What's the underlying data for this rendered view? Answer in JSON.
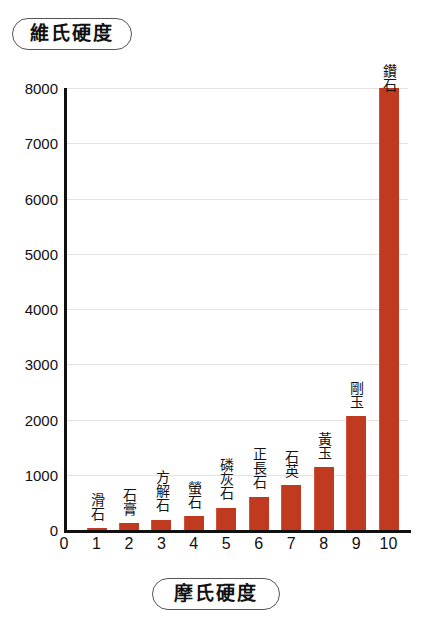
{
  "axis_titles": {
    "y": "維氏硬度",
    "x": "摩氏硬度"
  },
  "colors": {
    "bar": "#bf3a1e",
    "bar_highlight": "#d0543a",
    "axis": "#111111",
    "gridline": "#e6e2e0",
    "background": "#ffffff"
  },
  "chart_data": {
    "type": "bar",
    "title": "",
    "subtitle": "",
    "xlabel": "摩氏硬度",
    "ylabel": "維氏硬度",
    "categories": [
      1,
      2,
      3,
      4,
      5,
      6,
      7,
      8,
      9,
      10
    ],
    "values": [
      30,
      120,
      190,
      260,
      400,
      600,
      820,
      1150,
      2060,
      8000
    ],
    "point_labels": [
      "滑石",
      "石膏",
      "方解石",
      "螢石",
      "磷灰石",
      "正長石",
      "石英",
      "黃玉",
      "剛玉",
      "鑽石"
    ],
    "series": [
      {
        "name": "維氏硬度",
        "values": [
          30,
          120,
          190,
          260,
          400,
          600,
          820,
          1150,
          2060,
          8000
        ]
      }
    ],
    "xlim": [
      0,
      10.6
    ],
    "ylim": [
      0,
      8000
    ],
    "xticks": [
      0,
      1,
      2,
      3,
      4,
      5,
      6,
      7,
      8,
      9,
      10
    ],
    "xtick_labels": [
      "0",
      "1",
      "2",
      "3",
      "4",
      "5",
      "6",
      "7",
      "8",
      "9",
      "10"
    ],
    "yticks": [
      0,
      1000,
      2000,
      3000,
      4000,
      5000,
      6000,
      7000,
      8000
    ],
    "ytick_labels": [
      "0",
      "1000",
      "2000",
      "3000",
      "4000",
      "5000",
      "6000",
      "7000",
      "8000"
    ],
    "grid": true,
    "grid_axis": "y",
    "legend": false,
    "legend_position": "none"
  }
}
